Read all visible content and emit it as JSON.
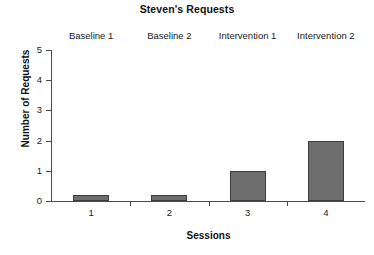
{
  "chart_data": {
    "type": "bar",
    "title": "Steven's Requests",
    "xlabel": "Sessions",
    "ylabel": "Number of Requests",
    "categories": [
      "1",
      "2",
      "3",
      "4"
    ],
    "values": [
      0,
      0,
      1,
      2
    ],
    "ylim": [
      0,
      5
    ],
    "ytick_labels": [
      "0",
      "1",
      "2",
      "3",
      "4",
      "5"
    ],
    "ytick_values": [
      0,
      1,
      2,
      3,
      4,
      5
    ],
    "grid": false,
    "legend": null,
    "bar_color": "#6e6e6e",
    "bar_edge_color": "#3d3d3d",
    "axis_color": "#4a4a4a",
    "background": "#ffffff",
    "phase_labels": [
      "Baseline 1",
      "Baseline 2",
      "Intervention 1",
      "Intervention 2"
    ],
    "annotations": []
  }
}
